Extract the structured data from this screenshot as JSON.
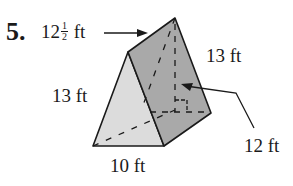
{
  "problem": {
    "number": "5."
  },
  "figure": {
    "type": "triangular-prism",
    "colors": {
      "front_face": "#dcdcdc",
      "side_face": "#a9a9a9",
      "stroke": "#1a1a1a"
    },
    "labels": {
      "length_whole": "12",
      "length_frac_num": "1",
      "length_frac_den": "2",
      "length_unit": "ft",
      "left_edge": "13 ft",
      "right_edge": "13 ft",
      "base": "10 ft",
      "height": "12 ft"
    }
  }
}
